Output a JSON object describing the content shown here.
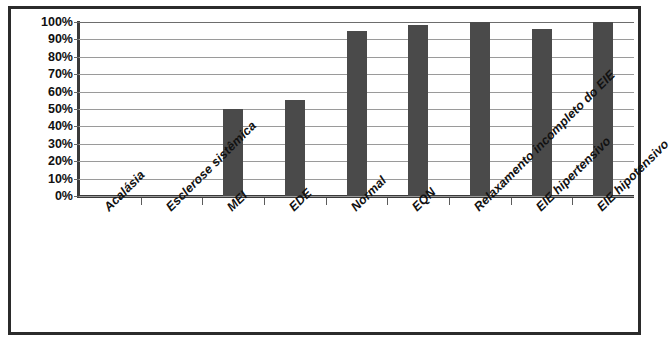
{
  "chart_data": {
    "type": "bar",
    "title": "",
    "subtitle": "",
    "xlabel": "",
    "ylabel": "",
    "categories": [
      "Acalásia",
      "Esclerose sistêmica",
      "MEI",
      "EDE",
      "Normal",
      "EQN",
      "Relaxamento incompleto do EIE",
      "EIE hipertensivo",
      "EIE hipotensivo"
    ],
    "values": [
      0,
      0,
      50,
      55,
      95,
      98,
      100,
      96,
      100
    ],
    "value_suffix": "%",
    "ylim": [
      0,
      100
    ],
    "ytick_labels": [
      "100%",
      "90%",
      "80%",
      "70%",
      "60%",
      "50%",
      "40%",
      "30%",
      "20%",
      "10%",
      "0%"
    ],
    "ytick_values": [
      100,
      90,
      80,
      70,
      60,
      50,
      40,
      30,
      20,
      10,
      0
    ],
    "grid": true,
    "legend": false,
    "legend_position": "none",
    "bar_color": "#4a4a4a",
    "gridline_color": "#9a9a9a",
    "axis_color": "#3a3a3a",
    "frame_color": "#2b2b2b",
    "label_rotation_degrees": -45
  }
}
